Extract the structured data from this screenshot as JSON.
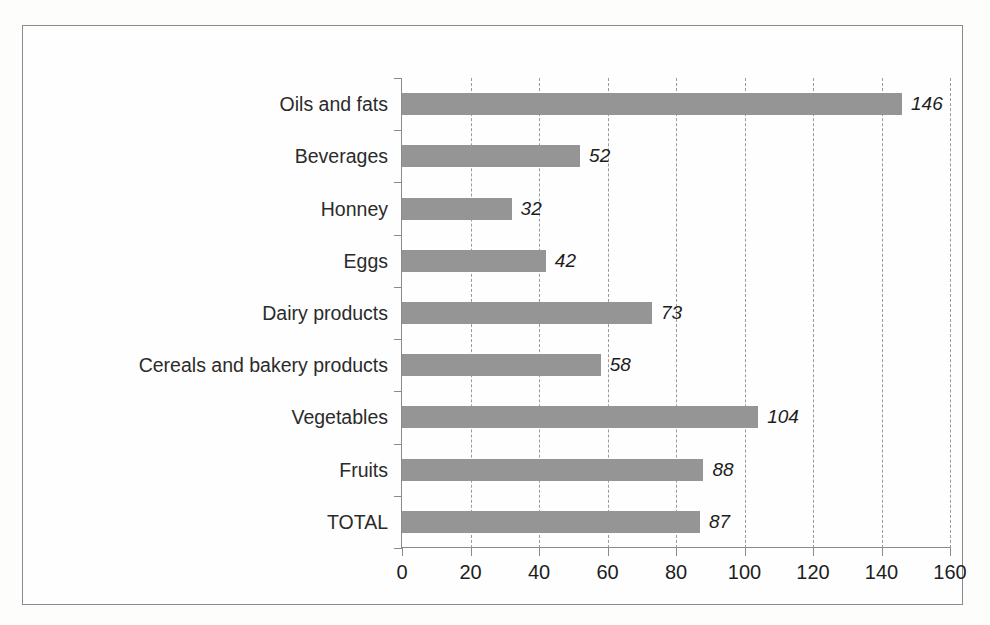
{
  "chart_data": {
    "type": "bar",
    "orientation": "horizontal",
    "title": "",
    "subtitle": "",
    "xlabel": "",
    "ylabel": "",
    "xlim": [
      0,
      160
    ],
    "xticks": [
      0,
      20,
      40,
      60,
      80,
      100,
      120,
      140,
      160
    ],
    "xtick_labels": [
      "0",
      "20",
      "40",
      "60",
      "80",
      "100",
      "120",
      "140",
      "160"
    ],
    "grid": "vertical-dashed",
    "legend": "none",
    "bar_color": "#959595",
    "axis_color": "#8a8a8a",
    "gridline_color": "#9a9a9a",
    "label_color": "#1d1d1d",
    "categories": [
      "Oils and fats",
      "Beverages",
      "Honney",
      "Eggs",
      "Dairy products",
      "Cereals and bakery products",
      "Vegetables",
      "Fruits",
      "TOTAL"
    ],
    "values": [
      146,
      52,
      32,
      42,
      73,
      58,
      104,
      88,
      87
    ],
    "data_labels": [
      "146",
      "52",
      "32",
      "42",
      "73",
      "58",
      "104",
      "88",
      "87"
    ],
    "data_label_style": "italic"
  }
}
